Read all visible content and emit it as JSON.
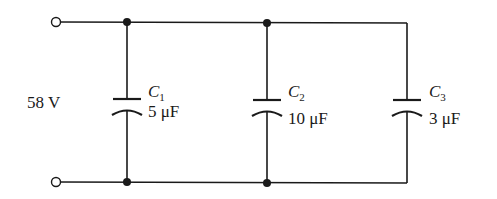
{
  "diagram": {
    "type": "circuit-schematic",
    "source": {
      "label": "58 V",
      "value": 58,
      "unit": "V"
    },
    "capacitors": [
      {
        "symbol": "C",
        "subscript": "1",
        "value_label": "5 μF",
        "value": 5,
        "unit": "μF"
      },
      {
        "symbol": "C",
        "subscript": "2",
        "value_label": "10 μF",
        "value": 10,
        "unit": "μF"
      },
      {
        "symbol": "C",
        "subscript": "3",
        "value_label": "3 μF",
        "value": 3,
        "unit": "μF"
      }
    ],
    "connection": "parallel",
    "colors": {
      "ink": "#1a1a1a",
      "background": "#ffffff"
    }
  }
}
